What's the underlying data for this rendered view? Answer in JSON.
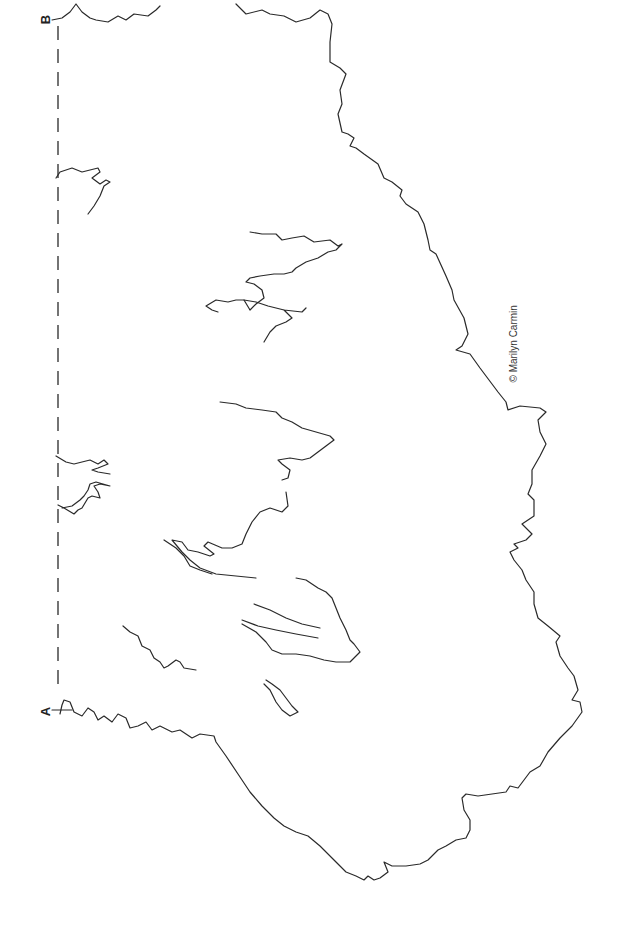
{
  "diagram": {
    "labels": {
      "start": "A",
      "end": "B"
    },
    "credit": "© Marilyn Carmin",
    "line_color": "#2a2a2a",
    "background": "#ffffff"
  }
}
